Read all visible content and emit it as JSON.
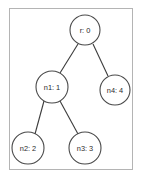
{
  "diagram": {
    "frame": {
      "border_color": "#b4b4b4",
      "background": "#ffffff"
    },
    "style": {
      "node_fill": "#ffffff",
      "node_stroke": "#4a4a4a",
      "edge_stroke": "#3a3a3a",
      "label_color": "#2b2b2b"
    },
    "nodes": [
      {
        "id": "r",
        "label": "r: 0",
        "cx": 85,
        "cy": 30,
        "r": 15
      },
      {
        "id": "n1",
        "label": "n1: 1",
        "cx": 52,
        "cy": 87,
        "r": 16
      },
      {
        "id": "n4",
        "label": "n4: 4",
        "cx": 115,
        "cy": 90,
        "r": 15
      },
      {
        "id": "n2",
        "label": "n2: 2",
        "cx": 28,
        "cy": 148,
        "r": 16
      },
      {
        "id": "n3",
        "label": "n3: 3",
        "cx": 85,
        "cy": 148,
        "r": 16
      }
    ],
    "edges": [
      {
        "from": "r",
        "to": "n1",
        "x1": 78,
        "y1": 44,
        "x2": 60,
        "y2": 73
      },
      {
        "from": "r",
        "to": "n4",
        "x1": 93,
        "y1": 44,
        "x2": 108,
        "y2": 76
      },
      {
        "from": "n1",
        "to": "n2",
        "x1": 44,
        "y1": 101,
        "x2": 35,
        "y2": 134
      },
      {
        "from": "n1",
        "to": "n3",
        "x1": 60,
        "y1": 101,
        "x2": 78,
        "y2": 134
      }
    ]
  }
}
